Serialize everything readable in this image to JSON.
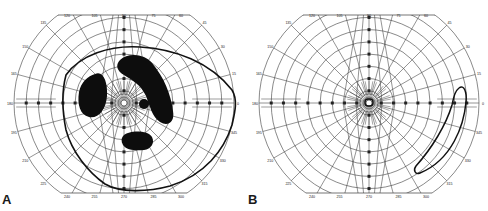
{
  "figure": {
    "type": "goldmann-visual-field-charts",
    "colors": {
      "grid": "#3a3a3a",
      "isopter": "#111111",
      "scotoma": "#0d0d0d",
      "background": "#ffffff"
    }
  },
  "chart_data": [
    {
      "type": "polar-perimetry",
      "panel": "A",
      "meridian_labels": [
        "0",
        "15",
        "30",
        "45",
        "60",
        "75",
        "90",
        "105",
        "120",
        "135",
        "150",
        "165",
        "180",
        "195",
        "210",
        "225",
        "240",
        "255",
        "270",
        "285",
        "300",
        "315",
        "330",
        "345"
      ],
      "ring_count": 9,
      "radial_spokes_deg": 15,
      "isopter": "large irregular closed contour enclosing most of field",
      "scotomas": [
        {
          "name": "left-paracentral",
          "shape": "vertical oval"
        },
        {
          "name": "upper-arcuate",
          "shape": "curved comma band from upper-center to right"
        },
        {
          "name": "small-right-central",
          "shape": "small round spot"
        },
        {
          "name": "inferior",
          "shape": "horizontal oval below center"
        }
      ]
    },
    {
      "type": "polar-perimetry",
      "panel": "B",
      "meridian_labels": [
        "0",
        "15",
        "30",
        "45",
        "60",
        "75",
        "90",
        "105",
        "120",
        "135",
        "150",
        "165",
        "180",
        "195",
        "210",
        "225",
        "240",
        "255",
        "270",
        "285",
        "300",
        "315",
        "330",
        "345"
      ],
      "ring_count": 9,
      "radial_spokes_deg": 15,
      "isopter": "small central island + narrow temporal crescent in right periphery",
      "scotomas": []
    }
  ],
  "panels": [
    {
      "label": "A"
    },
    {
      "label": "B"
    }
  ]
}
